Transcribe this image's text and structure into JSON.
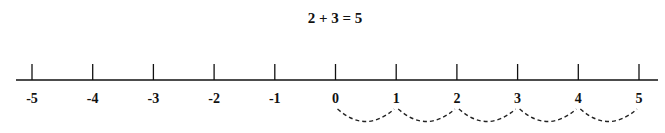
{
  "title": "2 + 3 = 5",
  "number_line": {
    "min": -5,
    "max": 5,
    "ticks": [
      {
        "value": -5,
        "label": "-5"
      },
      {
        "value": -4,
        "label": "-4"
      },
      {
        "value": -3,
        "label": "-3"
      },
      {
        "value": -2,
        "label": "-2"
      },
      {
        "value": -1,
        "label": "-1"
      },
      {
        "value": 0,
        "label": "0"
      },
      {
        "value": 1,
        "label": "1"
      },
      {
        "value": 2,
        "label": "2"
      },
      {
        "value": 3,
        "label": "3"
      },
      {
        "value": 4,
        "label": "4"
      },
      {
        "value": 5,
        "label": "5"
      }
    ],
    "hops": [
      {
        "from": 0,
        "to": 1
      },
      {
        "from": 1,
        "to": 2
      },
      {
        "from": 2,
        "to": 3
      },
      {
        "from": 3,
        "to": 4
      },
      {
        "from": 4,
        "to": 5
      }
    ],
    "hop_style": "dashed-arc-below"
  },
  "colors": {
    "line": "#111111",
    "text": "#111111",
    "background": "#ffffff"
  }
}
